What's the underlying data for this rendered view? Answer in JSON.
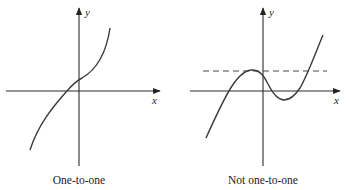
{
  "figure": {
    "panels": [
      {
        "caption": "One-to-one",
        "x_axis_label": "x",
        "y_axis_label": "y",
        "curve_description": "monotonically increasing cubic-like curve"
      },
      {
        "caption": "Not one-to-one",
        "x_axis_label": "x",
        "y_axis_label": "y",
        "curve_description": "cubic with local max and local min; horizontal dashed line intersects curve at three points",
        "horizontal_line_test": "dashed"
      }
    ]
  },
  "colors": {
    "axis": "#2b2b2b",
    "curve": "#3a3a3a",
    "dash": "#4a4a4a",
    "background": "#ffffff"
  }
}
